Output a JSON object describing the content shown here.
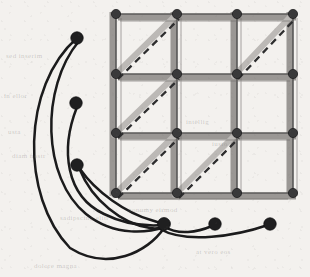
{
  "figure": {
    "title": "Grid graph with diagonal edges and pendant vertex curves",
    "width": 310,
    "height": 277,
    "background_color": "#f3f1ee",
    "paper_scan": true
  },
  "style": {
    "grid_band_color": "#9a9794",
    "grid_band_width": 7,
    "grid_line_color": "#3a3a3a",
    "grid_line_width": 1.1,
    "node_fill": "#39393a",
    "node_stroke": "#202021",
    "grid_node_radius": 4.6,
    "free_node_radius": 6.2,
    "diagonal_band_color": "#b9b6b3",
    "diagonal_band_width": 6,
    "diagonal_dash_color": "#2e2e2f",
    "diagonal_dash_width": 2.3,
    "diagonal_dash_pattern": "7 5",
    "curve_color": "#1b1b1c",
    "curve_width": 2.5
  },
  "grid": {
    "rows": 4,
    "cols": 4,
    "cells_rows": 3,
    "cells_cols": 3,
    "x_positions": [
      116,
      177,
      237,
      293
    ],
    "y_positions": [
      14,
      74,
      133,
      193
    ],
    "node_count": 16,
    "nodes": [
      {
        "id": "g00",
        "x": 116,
        "y": 14
      },
      {
        "id": "g10",
        "x": 177,
        "y": 14
      },
      {
        "id": "g20",
        "x": 237,
        "y": 14
      },
      {
        "id": "g30",
        "x": 293,
        "y": 14
      },
      {
        "id": "g01",
        "x": 116,
        "y": 74
      },
      {
        "id": "g11",
        "x": 177,
        "y": 74
      },
      {
        "id": "g21",
        "x": 237,
        "y": 74
      },
      {
        "id": "g31",
        "x": 293,
        "y": 74
      },
      {
        "id": "g02",
        "x": 116,
        "y": 133
      },
      {
        "id": "g12",
        "x": 177,
        "y": 133
      },
      {
        "id": "g22",
        "x": 237,
        "y": 133
      },
      {
        "id": "g32",
        "x": 293,
        "y": 133
      },
      {
        "id": "g03",
        "x": 116,
        "y": 193
      },
      {
        "id": "g13",
        "x": 177,
        "y": 193
      },
      {
        "id": "g23",
        "x": 237,
        "y": 193
      },
      {
        "id": "g33",
        "x": 293,
        "y": 193
      }
    ],
    "horizontal_edges": [
      {
        "x1": 116,
        "y1": 14,
        "x2": 293,
        "y2": 14
      },
      {
        "x1": 116,
        "y1": 74,
        "x2": 293,
        "y2": 74
      },
      {
        "x1": 116,
        "y1": 133,
        "x2": 293,
        "y2": 133
      },
      {
        "x1": 116,
        "y1": 193,
        "x2": 293,
        "y2": 193
      }
    ],
    "vertical_edges": [
      {
        "x1": 116,
        "y1": 14,
        "x2": 116,
        "y2": 193
      },
      {
        "x1": 177,
        "y1": 14,
        "x2": 177,
        "y2": 193
      },
      {
        "x1": 237,
        "y1": 14,
        "x2": 237,
        "y2": 193
      },
      {
        "x1": 293,
        "y1": 14,
        "x2": 293,
        "y2": 193
      }
    ],
    "diagonals": [
      {
        "cell_row": 0,
        "cell_col": 0,
        "x1": 116,
        "y1": 74,
        "x2": 177,
        "y2": 14,
        "direction": "bottom-left-to-top-right"
      },
      {
        "cell_row": 0,
        "cell_col": 2,
        "x1": 237,
        "y1": 74,
        "x2": 293,
        "y2": 14,
        "direction": "bottom-left-to-top-right"
      },
      {
        "cell_row": 1,
        "cell_col": 0,
        "x1": 116,
        "y1": 133,
        "x2": 177,
        "y2": 74,
        "direction": "bottom-left-to-top-right"
      },
      {
        "cell_row": 2,
        "cell_col": 0,
        "x1": 116,
        "y1": 193,
        "x2": 177,
        "y2": 133,
        "direction": "bottom-left-to-top-right"
      },
      {
        "cell_row": 2,
        "cell_col": 1,
        "x1": 177,
        "y1": 193,
        "x2": 237,
        "y2": 133,
        "direction": "bottom-left-to-top-right"
      }
    ],
    "diagonal_count": 5,
    "cells_without_diagonal": [
      {
        "cell_row": 0,
        "cell_col": 1
      },
      {
        "cell_row": 1,
        "cell_col": 1
      },
      {
        "cell_row": 1,
        "cell_col": 2
      },
      {
        "cell_row": 2,
        "cell_col": 2
      }
    ]
  },
  "free_nodes": [
    {
      "id": "a",
      "label": "",
      "x": 77,
      "y": 38
    },
    {
      "id": "b",
      "label": "",
      "x": 76,
      "y": 103
    },
    {
      "id": "c",
      "label": "",
      "x": 77,
      "y": 165
    },
    {
      "id": "hub",
      "label": "",
      "x": 164,
      "y": 224
    },
    {
      "id": "d",
      "label": "",
      "x": 215,
      "y": 224
    },
    {
      "id": "e",
      "label": "",
      "x": 270,
      "y": 224
    }
  ],
  "free_node_count": 6,
  "curves": [
    {
      "id": "curve-a-hub-outer",
      "from": "a",
      "to": "hub",
      "path": "M 77 38 C 22 86 20 196 70 248 C 108 272 148 252 164 228"
    },
    {
      "id": "curve-a-hub-inner",
      "from": "a",
      "to": "hub",
      "path": "M 79 41 C 40 88 42 178 86 214 C 116 238 150 232 165 227"
    },
    {
      "id": "curve-b-hub",
      "from": "b",
      "to": "hub",
      "path": "M 77 107 C 60 150 66 196 104 214 C 130 227 152 226 164 225"
    },
    {
      "id": "curve-c-hub-upper",
      "from": "c",
      "to": "hub",
      "path": "M 80 169 C 96 192 126 213 151 220 C 157 222 161 223 164 224"
    },
    {
      "id": "curve-c-hub-lower",
      "from": "c",
      "to": "hub",
      "path": "M 80 170 C 92 200 122 224 150 228 C 156 229 161 228 164 226"
    },
    {
      "id": "curve-hub-d",
      "from": "hub",
      "to": "d",
      "path": "M 164 226 C 178 236 198 232 212 226"
    },
    {
      "id": "curve-hub-e",
      "from": "hub",
      "to": "e",
      "path": "M 160 229 C 186 244 236 236 268 225"
    }
  ],
  "curve_count": 7,
  "ghost_text_fragments": [
    {
      "text": "sed inserim",
      "x": 6,
      "y": 52
    },
    {
      "text": "in ellor",
      "x": 4,
      "y": 92
    },
    {
      "text": "usta",
      "x": 8,
      "y": 128
    },
    {
      "text": "diam nostr",
      "x": 12,
      "y": 152
    },
    {
      "text": "intellig",
      "x": 186,
      "y": 118
    },
    {
      "text": "iusto",
      "x": 212,
      "y": 140
    },
    {
      "text": "nonumy eirmod",
      "x": 128,
      "y": 206
    },
    {
      "text": "sadipscing elitr",
      "x": 60,
      "y": 214
    },
    {
      "text": "at vero eos",
      "x": 196,
      "y": 248
    },
    {
      "text": "dolore magna",
      "x": 34,
      "y": 262
    }
  ]
}
